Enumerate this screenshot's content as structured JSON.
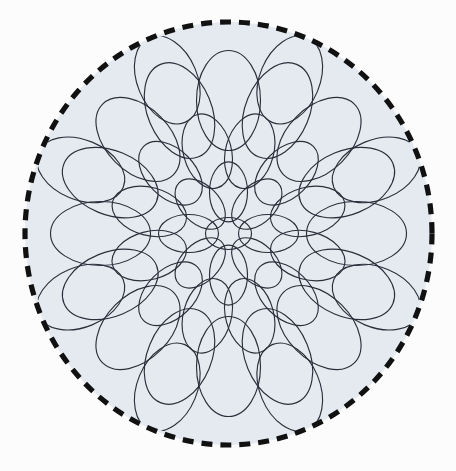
{
  "figure": {
    "title": "Radial packing of ellipses in a dashed circular boundary",
    "type": "geometric-diagram",
    "canvas": {
      "width": 456,
      "height": 471,
      "background_color": "#fcfcfc"
    }
  },
  "boundary": {
    "name": "dashed-circle",
    "shape": "circle",
    "center_x": 228.5,
    "center_y": 233.5,
    "radius_x": 203.5,
    "radius_y": 211.5,
    "fill_color": "#e4eaf0",
    "stroke_color": "#111111",
    "stroke_width": 5.2,
    "dash_pattern": "11 8",
    "dash_cap": "butt"
  },
  "pattern": {
    "name": "radial-ellipse-packing",
    "description": "Concentric rings of ellipses whose major axes point radially outward from the disk center.",
    "stroke_color": "#2a2f3a",
    "stroke_width": 1.15,
    "fill": "none",
    "total_ellipses": 45,
    "ring_count": 4,
    "rings": [
      {
        "index": 0,
        "label": "center",
        "count": 1,
        "radius": 0,
        "rx": 23,
        "ry": 16,
        "angle_offset_deg": 0
      },
      {
        "index": 1,
        "label": "inner",
        "count": 8,
        "radius": 40,
        "rx": 30,
        "ry": 19,
        "angle_offset_deg": 0
      },
      {
        "index": 2,
        "label": "middle",
        "count": 12,
        "radius": 82,
        "rx": 38,
        "ry": 24,
        "angle_offset_deg": 15
      },
      {
        "index": 3,
        "label": "outer",
        "count": 16,
        "radius": 128,
        "rx": 50,
        "ry": 32,
        "angle_offset_deg": 0
      },
      {
        "index": 4,
        "label": "rim",
        "count": 8,
        "radius": 160,
        "rx": 46,
        "ry": 30,
        "angle_offset_deg": 22.5
      }
    ]
  },
  "chart_data": {
    "type": "scatter",
    "title": "Radial packing of ellipses in a dashed circular boundary",
    "xlabel": "",
    "ylabel": "",
    "grid": false,
    "legend": "none",
    "xlim": [
      25,
      432
    ],
    "ylim": [
      22,
      445
    ],
    "series": [
      {
        "name": "dashed-boundary-circle",
        "values": [
          {
            "cx": 228.5,
            "cy": 233.5,
            "rx": 203.5,
            "ry": 211.5
          }
        ]
      },
      {
        "name": "ellipse-cells",
        "count": 45,
        "note": "Each ellipse has major axis aligned with the radius vector from the disk center; size grows with distance from center."
      }
    ]
  }
}
